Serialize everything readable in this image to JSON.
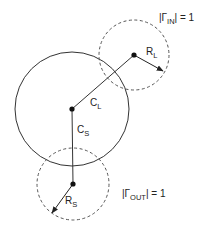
{
  "diagram": {
    "type": "stability-circles",
    "colors": {
      "stroke": "#333333",
      "text": "#222222",
      "background": "#ffffff"
    },
    "main_circle": {
      "style": "solid",
      "center": [
        72,
        109
      ],
      "radius": 57
    },
    "input_circle": {
      "style": "dashed",
      "center": [
        134,
        55
      ],
      "radius": 35,
      "label": "|Γ",
      "label_sub": "IN",
      "label_tail": "| = 1"
    },
    "output_circle": {
      "style": "dashed",
      "center": [
        73,
        184
      ],
      "radius": 36,
      "label": "|Γ",
      "label_sub": "OUT",
      "label_tail": "| = 1"
    },
    "vectors": {
      "CL": {
        "label": "C",
        "sub": "L",
        "from": [
          72,
          109
        ],
        "to": [
          134,
          55
        ]
      },
      "CS": {
        "label": "C",
        "sub": "S",
        "from": [
          72,
          109
        ],
        "to": [
          73,
          184
        ]
      },
      "RL": {
        "label": "R",
        "sub": "L",
        "from": [
          134,
          55
        ],
        "to": [
          163,
          71
        ]
      },
      "RS": {
        "label": "R",
        "sub": "S",
        "from": [
          73,
          184
        ],
        "to": [
          52,
          213
        ]
      }
    }
  }
}
